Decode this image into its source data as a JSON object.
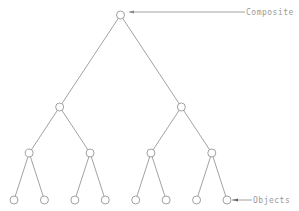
{
  "diagram": {
    "type": "tree",
    "labels": {
      "composite": "Composite",
      "objects": "Objects"
    },
    "tree": {
      "id": "root",
      "children": [
        {
          "id": "n1",
          "children": [
            {
              "id": "n11",
              "children": [
                {
                  "id": "l1"
                },
                {
                  "id": "l2"
                }
              ]
            },
            {
              "id": "n12",
              "children": [
                {
                  "id": "l3"
                },
                {
                  "id": "l4"
                }
              ]
            }
          ]
        },
        {
          "id": "n2",
          "children": [
            {
              "id": "n21",
              "children": [
                {
                  "id": "l5"
                },
                {
                  "id": "l6"
                }
              ]
            },
            {
              "id": "n22",
              "children": [
                {
                  "id": "l7"
                },
                {
                  "id": "l8"
                }
              ]
            }
          ]
        }
      ]
    },
    "annotations": [
      {
        "label_key": "composite",
        "points_to": "root"
      },
      {
        "label_key": "objects",
        "points_to": "l8"
      }
    ],
    "colors": {
      "line": "#8a8a8a",
      "text": "#9a9a9a",
      "background": "#ffffff"
    }
  }
}
